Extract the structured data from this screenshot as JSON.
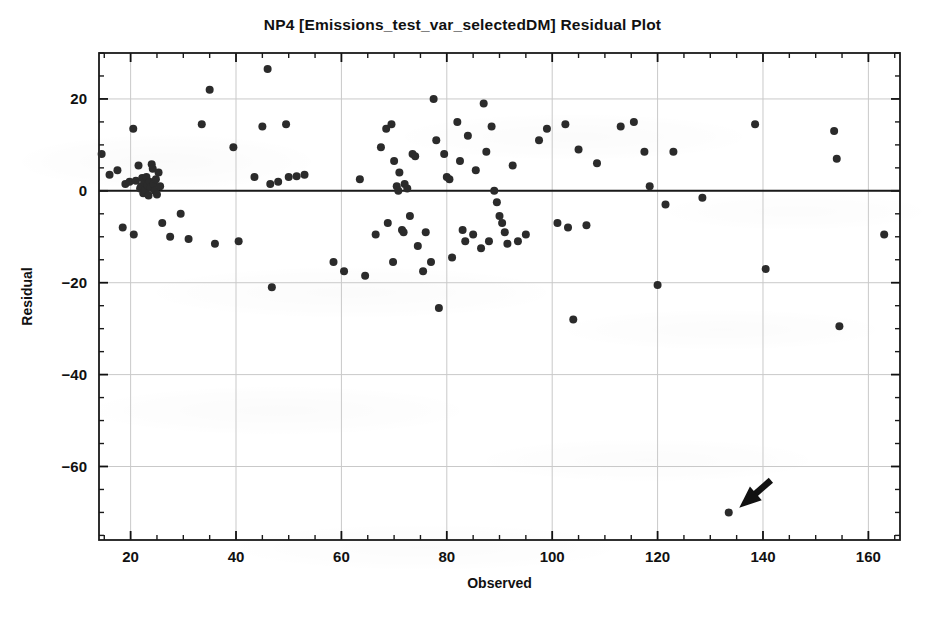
{
  "chart_data": {
    "type": "scatter",
    "title": "NP4  [Emissions_test_var_selectedDM] Residual Plot",
    "xlabel": "Observed",
    "ylabel": "Residual",
    "xlim": [
      14,
      166
    ],
    "ylim": [
      -76,
      30
    ],
    "xticks": [
      20,
      40,
      60,
      80,
      100,
      120,
      140,
      160
    ],
    "xtick_labels": [
      "20",
      "40",
      "60",
      "80",
      "100",
      "120",
      "140",
      "160"
    ],
    "yticks": [
      20,
      0,
      -20,
      -40,
      -60
    ],
    "ytick_labels": [
      "20",
      "0",
      "−20",
      "−40",
      "−60"
    ],
    "x_minor_tick_step": 5,
    "y_minor_tick_step": 5,
    "grid": true,
    "grid_color": "#c9c9c9",
    "zero_line": 0,
    "zero_line_color": "#1a1a1a",
    "marker_color": "#2b2b2b",
    "marker_size_px": 8,
    "legend": null,
    "points": [
      {
        "x": 14.5,
        "y": 8.0
      },
      {
        "x": 16.0,
        "y": 3.5
      },
      {
        "x": 17.5,
        "y": 4.5
      },
      {
        "x": 18.5,
        "y": -8.0
      },
      {
        "x": 19.0,
        "y": 1.5
      },
      {
        "x": 19.8,
        "y": 2.0
      },
      {
        "x": 20.5,
        "y": 13.5
      },
      {
        "x": 20.6,
        "y": -9.5
      },
      {
        "x": 21.0,
        "y": 2.2
      },
      {
        "x": 21.5,
        "y": 5.5
      },
      {
        "x": 21.8,
        "y": 0.5
      },
      {
        "x": 22.0,
        "y": 1.0
      },
      {
        "x": 22.2,
        "y": 2.8
      },
      {
        "x": 22.4,
        "y": -0.5
      },
      {
        "x": 22.6,
        "y": 1.8
      },
      {
        "x": 22.8,
        "y": 0.2
      },
      {
        "x": 23.0,
        "y": 3.0
      },
      {
        "x": 23.2,
        "y": 1.2
      },
      {
        "x": 23.4,
        "y": -1.0
      },
      {
        "x": 23.6,
        "y": 2.0
      },
      {
        "x": 23.8,
        "y": 0.8
      },
      {
        "x": 24.0,
        "y": 5.8
      },
      {
        "x": 24.2,
        "y": 4.8
      },
      {
        "x": 24.4,
        "y": 1.5
      },
      {
        "x": 24.6,
        "y": 0.0
      },
      {
        "x": 24.8,
        "y": 2.5
      },
      {
        "x": 25.0,
        "y": -0.8
      },
      {
        "x": 25.3,
        "y": 4.0
      },
      {
        "x": 25.6,
        "y": 1.0
      },
      {
        "x": 26.0,
        "y": -7.0
      },
      {
        "x": 27.5,
        "y": -10.0
      },
      {
        "x": 29.5,
        "y": -5.0
      },
      {
        "x": 31.0,
        "y": -10.5
      },
      {
        "x": 33.5,
        "y": 14.5
      },
      {
        "x": 35.0,
        "y": 22.0
      },
      {
        "x": 36.0,
        "y": -11.5
      },
      {
        "x": 39.5,
        "y": 9.5
      },
      {
        "x": 40.5,
        "y": -11.0
      },
      {
        "x": 43.5,
        "y": 3.0
      },
      {
        "x": 45.0,
        "y": 14.0
      },
      {
        "x": 46.0,
        "y": 26.5
      },
      {
        "x": 46.5,
        "y": 1.5
      },
      {
        "x": 46.8,
        "y": -21.0
      },
      {
        "x": 48.0,
        "y": 2.0
      },
      {
        "x": 49.5,
        "y": 14.5
      },
      {
        "x": 50.0,
        "y": 3.0
      },
      {
        "x": 51.5,
        "y": 3.2
      },
      {
        "x": 53.0,
        "y": 3.5
      },
      {
        "x": 58.5,
        "y": -15.5
      },
      {
        "x": 60.5,
        "y": -17.5
      },
      {
        "x": 63.5,
        "y": 2.5
      },
      {
        "x": 64.5,
        "y": -18.5
      },
      {
        "x": 66.5,
        "y": -9.5
      },
      {
        "x": 67.5,
        "y": 9.5
      },
      {
        "x": 68.5,
        "y": 13.5
      },
      {
        "x": 68.8,
        "y": -7.0
      },
      {
        "x": 69.5,
        "y": 14.5
      },
      {
        "x": 69.8,
        "y": -15.5
      },
      {
        "x": 70.0,
        "y": 6.5
      },
      {
        "x": 70.5,
        "y": 1.0
      },
      {
        "x": 70.8,
        "y": 0.0
      },
      {
        "x": 71.0,
        "y": 4.0
      },
      {
        "x": 71.5,
        "y": -8.5
      },
      {
        "x": 71.8,
        "y": -9.0
      },
      {
        "x": 72.0,
        "y": 1.5
      },
      {
        "x": 72.5,
        "y": 0.5
      },
      {
        "x": 73.0,
        "y": -5.5
      },
      {
        "x": 73.5,
        "y": 8.0
      },
      {
        "x": 74.0,
        "y": 7.5
      },
      {
        "x": 74.5,
        "y": -12.0
      },
      {
        "x": 75.5,
        "y": -17.5
      },
      {
        "x": 76.0,
        "y": -9.0
      },
      {
        "x": 77.0,
        "y": -15.5
      },
      {
        "x": 77.5,
        "y": 20.0
      },
      {
        "x": 78.0,
        "y": 11.0
      },
      {
        "x": 78.5,
        "y": -25.5
      },
      {
        "x": 79.5,
        "y": 8.0
      },
      {
        "x": 80.0,
        "y": 3.0
      },
      {
        "x": 80.5,
        "y": 2.5
      },
      {
        "x": 81.0,
        "y": -14.5
      },
      {
        "x": 82.0,
        "y": 15.0
      },
      {
        "x": 82.5,
        "y": 6.5
      },
      {
        "x": 83.0,
        "y": -8.5
      },
      {
        "x": 83.5,
        "y": -11.0
      },
      {
        "x": 84.0,
        "y": 12.0
      },
      {
        "x": 85.0,
        "y": -9.5
      },
      {
        "x": 85.5,
        "y": 4.5
      },
      {
        "x": 86.5,
        "y": -12.5
      },
      {
        "x": 87.0,
        "y": 19.0
      },
      {
        "x": 87.5,
        "y": 8.5
      },
      {
        "x": 88.0,
        "y": -11.0
      },
      {
        "x": 88.5,
        "y": 14.0
      },
      {
        "x": 89.0,
        "y": 0.0
      },
      {
        "x": 89.5,
        "y": -2.5
      },
      {
        "x": 90.0,
        "y": -5.5
      },
      {
        "x": 90.5,
        "y": -7.0
      },
      {
        "x": 91.0,
        "y": -9.0
      },
      {
        "x": 91.5,
        "y": -11.5
      },
      {
        "x": 92.5,
        "y": 5.5
      },
      {
        "x": 93.5,
        "y": -11.0
      },
      {
        "x": 95.0,
        "y": -9.5
      },
      {
        "x": 97.5,
        "y": 11.0
      },
      {
        "x": 99.0,
        "y": 13.5
      },
      {
        "x": 101.0,
        "y": -7.0
      },
      {
        "x": 102.5,
        "y": 14.5
      },
      {
        "x": 103.0,
        "y": -8.0
      },
      {
        "x": 104.0,
        "y": -28.0
      },
      {
        "x": 105.0,
        "y": 9.0
      },
      {
        "x": 106.5,
        "y": -7.5
      },
      {
        "x": 108.5,
        "y": 6.0
      },
      {
        "x": 113.0,
        "y": 14.0
      },
      {
        "x": 115.5,
        "y": 15.0
      },
      {
        "x": 117.5,
        "y": 8.5
      },
      {
        "x": 118.5,
        "y": 1.0
      },
      {
        "x": 120.0,
        "y": -20.5
      },
      {
        "x": 121.5,
        "y": -3.0
      },
      {
        "x": 123.0,
        "y": 8.5
      },
      {
        "x": 128.5,
        "y": -1.5
      },
      {
        "x": 133.5,
        "y": -70.0
      },
      {
        "x": 138.5,
        "y": 14.5
      },
      {
        "x": 140.5,
        "y": -17.0
      },
      {
        "x": 153.5,
        "y": 13.0
      },
      {
        "x": 154.0,
        "y": 7.0
      },
      {
        "x": 154.5,
        "y": -29.5
      },
      {
        "x": 163.0,
        "y": -9.5
      }
    ],
    "annotations": [
      {
        "type": "arrow",
        "name": "outlier-callout-arrow",
        "tail": {
          "x": 141.5,
          "y": -63.0
        },
        "tip": {
          "x": 135.5,
          "y": -69.0
        },
        "color": "#111111",
        "target_point": {
          "x": 133.5,
          "y": -70.0
        }
      }
    ]
  }
}
